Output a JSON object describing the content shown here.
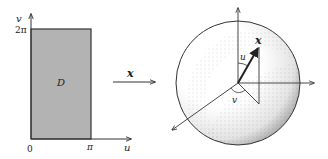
{
  "left_panel": {
    "region_label": "D",
    "axis_u_label": "u",
    "axis_v_label": "v",
    "origin_label": "0",
    "u_max_label": "π",
    "v_max_label": "2π"
  },
  "mapping": {
    "map_label": "x"
  },
  "right_panel": {
    "point_label": "x",
    "polar_angle_label": "u",
    "azimuth_angle_label": "v"
  },
  "colors": {
    "region_fill": "#b3b3b3",
    "line": "#333333",
    "stipple": "#555555"
  }
}
